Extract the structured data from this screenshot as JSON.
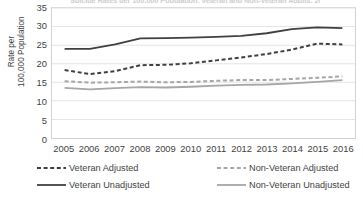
{
  "figure": {
    "title_cropped": "Suicide Rates per 100,000 Population, Veteran and Non-Veteran Adults, 2005-2016",
    "y_axis_title": "Rate per\n100,000 Population"
  },
  "chart_data": {
    "type": "line",
    "title": "Suicide Rates per 100,000 Population, Veteran and Non-Veteran Adults, 2005-2016",
    "xlabel": "",
    "ylabel": "Rate per 100,000 Population",
    "x": [
      2005,
      2006,
      2007,
      2008,
      2009,
      2010,
      2011,
      2012,
      2013,
      2014,
      2015,
      2016
    ],
    "categories": [
      "2005",
      "2006",
      "2007",
      "2008",
      "2009",
      "2010",
      "2011",
      "2012",
      "2013",
      "2014",
      "2015",
      "2016"
    ],
    "ylim": [
      0,
      35
    ],
    "yticks": [
      0,
      5,
      10,
      15,
      20,
      25,
      30,
      35
    ],
    "grid": true,
    "legend_position": "bottom",
    "series": [
      {
        "name": "Veteran Adjusted",
        "style": "dashed",
        "color": "#404040",
        "values": [
          18.3,
          17.2,
          18.0,
          19.6,
          19.7,
          20.1,
          20.9,
          21.7,
          22.6,
          23.8,
          25.4,
          25.2
        ]
      },
      {
        "name": "Non-Veteran Adjusted",
        "style": "dashed",
        "color": "#a6a6a6",
        "values": [
          15.3,
          14.9,
          15.0,
          15.2,
          15.0,
          15.1,
          15.4,
          15.6,
          15.6,
          15.9,
          16.2,
          16.6
        ]
      },
      {
        "name": "Veteran Unadjusted",
        "style": "solid",
        "color": "#404040",
        "values": [
          24.0,
          24.0,
          25.2,
          26.8,
          26.9,
          27.0,
          27.2,
          27.5,
          28.2,
          29.3,
          29.8,
          29.6
        ]
      },
      {
        "name": "Non-Veteran Unadjusted",
        "style": "solid",
        "color": "#a6a6a6",
        "values": [
          13.5,
          13.1,
          13.4,
          13.7,
          13.6,
          13.8,
          14.1,
          14.3,
          14.4,
          14.7,
          15.1,
          15.6
        ]
      }
    ]
  },
  "legend": {
    "items": [
      {
        "label": "Veteran Adjusted",
        "style": "dashed",
        "color": "#404040"
      },
      {
        "label": "Non-Veteran Adjusted",
        "style": "dashed",
        "color": "#a6a6a6"
      },
      {
        "label": "Veteran Unadjusted",
        "style": "solid",
        "color": "#404040"
      },
      {
        "label": "Non-Veteran Unadjusted",
        "style": "solid",
        "color": "#a6a6a6"
      }
    ]
  }
}
